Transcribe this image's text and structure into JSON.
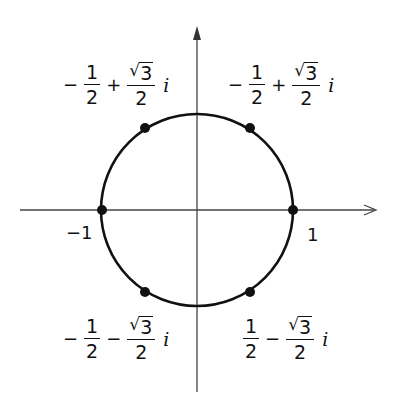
{
  "diagram": {
    "type": "complex-plane-unit-circle",
    "colors": {
      "stroke": "#111111",
      "background": "#ffffff",
      "axis": "#444444"
    },
    "geometry": {
      "center": [
        197,
        210
      ],
      "radius": 96
    },
    "axis_labels": {
      "neg_one": "−1",
      "one": "1"
    },
    "points": [
      {
        "name": "point-1",
        "angle_deg": 0
      },
      {
        "name": "point-60",
        "angle_deg": 60
      },
      {
        "name": "point-120",
        "angle_deg": 120
      },
      {
        "name": "point-180",
        "angle_deg": 180
      },
      {
        "name": "point-240",
        "angle_deg": 240
      },
      {
        "name": "point-300",
        "angle_deg": 300
      }
    ],
    "labels": {
      "top_left": {
        "sign1": "−",
        "num1": "1",
        "den1": "2",
        "op": "+",
        "num2": "3",
        "den2": "2",
        "rad": "√",
        "i": "i"
      },
      "top_right": {
        "sign1": "−",
        "num1": "1",
        "den1": "2",
        "op": "+",
        "num2": "3",
        "den2": "2",
        "rad": "√",
        "i": "i"
      },
      "bottom_left": {
        "sign1": "−",
        "num1": "1",
        "den1": "2",
        "op": "−",
        "num2": "3",
        "den2": "2",
        "rad": "√",
        "i": "i"
      },
      "bottom_right": {
        "sign1": "",
        "num1": "1",
        "den1": "2",
        "op": "−",
        "num2": "3",
        "den2": "2",
        "rad": "√",
        "i": "i"
      }
    }
  }
}
